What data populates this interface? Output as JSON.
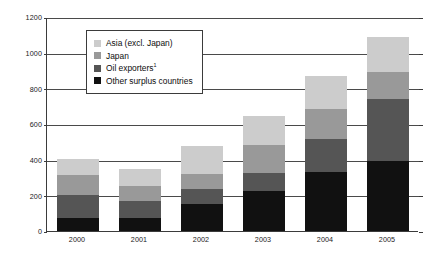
{
  "chart_data": {
    "type": "bar",
    "stacked": true,
    "title": "",
    "subtitle": "",
    "xlabel": "",
    "ylabel": "",
    "categories": [
      "2000",
      "2001",
      "2002",
      "2003",
      "2004",
      "2005"
    ],
    "ylim": [
      0,
      1200
    ],
    "yticks": [
      0,
      200,
      400,
      600,
      800,
      1000,
      1200
    ],
    "grid": true,
    "legend_position": "upper-left-inside",
    "series": [
      {
        "name": "Other surplus countries",
        "color": "#111111",
        "values": [
          75,
          75,
          150,
          225,
          330,
          395
        ]
      },
      {
        "name": "Oil exporters",
        "color": "#555555",
        "values": [
          125,
          95,
          85,
          100,
          185,
          345
        ]
      },
      {
        "name": "Japan",
        "color": "#999999",
        "values": [
          115,
          80,
          85,
          155,
          170,
          150
        ]
      },
      {
        "name": "Asia (excl. Japan)",
        "color": "#cccccc",
        "values": [
          90,
          95,
          155,
          165,
          185,
          200
        ]
      }
    ],
    "totals": [
      405,
      345,
      475,
      645,
      870,
      1090
    ],
    "annotations": [
      "1"
    ]
  },
  "legend": {
    "items": [
      {
        "label": "Asia (excl. Japan)",
        "color": "#cccccc",
        "footnote": ""
      },
      {
        "label": "Japan",
        "color": "#999999",
        "footnote": ""
      },
      {
        "label": "Oil exporters",
        "color": "#555555",
        "footnote": "1"
      },
      {
        "label": "Other surplus countries",
        "color": "#111111",
        "footnote": ""
      }
    ]
  },
  "axis": {
    "y_tick_labels": [
      "1200",
      "1000",
      "800",
      "600",
      "400",
      "200",
      "0"
    ],
    "x_tick_labels": [
      "2000",
      "2001",
      "2002",
      "2003",
      "2004",
      "2005"
    ]
  }
}
